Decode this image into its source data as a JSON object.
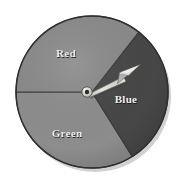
{
  "figure": {
    "kind": "spinner-wheel",
    "background_color": "#ffffff",
    "center_x": 92,
    "center_y": 92,
    "radius": 76,
    "outline_color": "#3a3a3a",
    "shadow_color": "#c9c9c9"
  },
  "sectors": [
    {
      "id": "red",
      "label": "Red",
      "fill": "#8a8a8a",
      "start_angle": 52,
      "end_angle": 180,
      "label_x": 66,
      "label_y": 53
    },
    {
      "id": "blue",
      "label": "Blue",
      "fill": "#474747",
      "start_angle": -58,
      "end_angle": 52,
      "label_x": 126,
      "label_y": 99
    },
    {
      "id": "green",
      "label": "Green",
      "fill": "#8d8d8d",
      "start_angle": 180,
      "end_angle": 302,
      "label_x": 67,
      "label_y": 133
    }
  ],
  "needle": {
    "name": "spinner-needle",
    "points_to": "Blue",
    "angle_degrees": 28,
    "body_color": "#d8d8d4",
    "body_shade_color": "#a8a8a4",
    "outline_color": "#5a5a5a",
    "tip_x": 140,
    "tip_y": 66,
    "hub": {
      "name": "needle-pivot-hub",
      "center_x": 87,
      "center_y": 92,
      "outer_radius": 5.2,
      "inner_radius": 2.2,
      "ring_color": "#dcdcd8",
      "hole_color": "#2b2b2b"
    }
  },
  "label_text_color": "#f2f2f0"
}
